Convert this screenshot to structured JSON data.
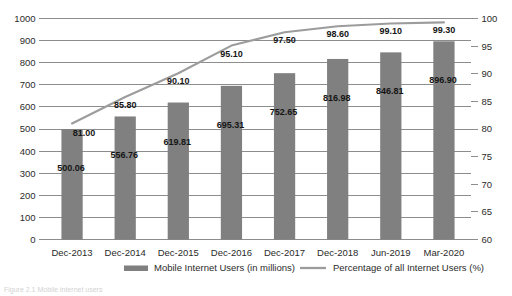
{
  "chart_data": {
    "type": "bar",
    "title": "",
    "subtitle": "",
    "xlabel": "",
    "ylabel": "",
    "y2label": "",
    "grid": true,
    "legend_position": "bottom",
    "categories": [
      "Dec-2013",
      "Dec-2014",
      "Dec-2015",
      "Dec-2016",
      "Dec-2017",
      "Dec-2018",
      "Jun-2019",
      "Mar-2020"
    ],
    "series": [
      {
        "name": "Mobile Internet Users (in millions)",
        "type": "bar",
        "axis": "left",
        "color": "#808080",
        "values": [
          500.06,
          556.76,
          619.81,
          695.31,
          752.65,
          816.98,
          846.81,
          896.9
        ],
        "value_labels": [
          "500.06",
          "556.76",
          "619.81",
          "695.31",
          "752.65",
          "816.98",
          "846.81",
          "896.90"
        ]
      },
      {
        "name": "Percentage of all Internet Users (%)",
        "type": "line",
        "axis": "right",
        "color": "#9c9c9c",
        "values": [
          81.0,
          85.8,
          90.1,
          95.1,
          97.5,
          98.6,
          99.1,
          99.3
        ],
        "value_labels": [
          "81.00",
          "85.80",
          "90.10",
          "95.10",
          "97.50",
          "98.60",
          "99.10",
          "99.30"
        ]
      }
    ],
    "ylim": [
      0,
      1000
    ],
    "yticks": [
      0,
      100,
      200,
      300,
      400,
      500,
      600,
      700,
      800,
      900,
      1000
    ],
    "ytick_labels": [
      "0",
      "100",
      "200",
      "300",
      "400",
      "500",
      "600",
      "700",
      "800",
      "900",
      "1000"
    ],
    "y2lim": [
      60,
      100
    ],
    "y2ticks": [
      60,
      65,
      70,
      75,
      80,
      85,
      90,
      95,
      100
    ],
    "y2tick_labels": [
      "60",
      "65",
      "70",
      "75",
      "80",
      "85",
      "90",
      "95",
      "100"
    ]
  },
  "legend": {
    "items": [
      {
        "label": "Mobile Internet Users (in millions)",
        "marker": "bar-swatch",
        "color": "#808080"
      },
      {
        "label": "Percentage of all Internet Users (%)",
        "marker": "line-swatch",
        "color": "#9c9c9c"
      }
    ]
  },
  "footnote": {
    "text": "Figure 2.1 Mobile internet users"
  }
}
